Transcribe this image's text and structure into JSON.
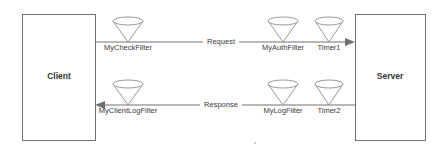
{
  "diagram": {
    "canvas": {
      "width": 443,
      "height": 152,
      "background": "#ffffff"
    },
    "colors": {
      "box_stroke": "#6f6f6f",
      "line_stroke": "#707070",
      "filter_stroke": "#8c8c8c",
      "text": "#333333",
      "fill": "#ffffff"
    },
    "nodes": [
      {
        "id": "client",
        "label": "Client",
        "x": 22,
        "y": 14,
        "width": 73,
        "height": 126
      },
      {
        "id": "server",
        "label": "Server",
        "x": 355,
        "y": 14,
        "width": 70,
        "height": 126
      }
    ],
    "flows": [
      {
        "id": "request",
        "label": "Request",
        "direction": "left-to-right",
        "from": "client",
        "to": "server",
        "y": 42,
        "label_x": 221,
        "filters": [
          {
            "id": "mycheckfilter",
            "label": "MyCheckFilter",
            "cx": 128,
            "icon": "funnel-icon"
          },
          {
            "id": "myauthfilter",
            "label": "MyAuthFilter",
            "cx": 283,
            "icon": "funnel-icon"
          },
          {
            "id": "timer1",
            "label": "Timer1",
            "cx": 329,
            "icon": "funnel-icon"
          }
        ]
      },
      {
        "id": "response",
        "label": "Response",
        "direction": "right-to-left",
        "from": "server",
        "to": "client",
        "y": 105,
        "label_x": 221,
        "filters": [
          {
            "id": "myclientlogfilter",
            "label": "MyClientLogFilter",
            "cx": 128,
            "icon": "funnel-icon"
          },
          {
            "id": "mylogfilter",
            "label": "MyLogFilter",
            "cx": 283,
            "icon": "funnel-icon"
          },
          {
            "id": "timer2",
            "label": "Timer2",
            "cx": 329,
            "icon": "funnel-icon"
          }
        ]
      }
    ],
    "artifacts": [
      {
        "id": "speck",
        "x": 255,
        "y": 143,
        "r": 1.1
      }
    ]
  }
}
